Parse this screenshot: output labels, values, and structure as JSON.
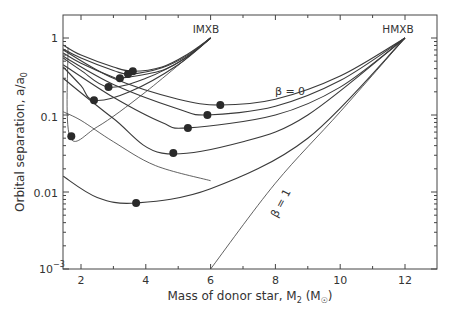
{
  "chart_data": {
    "type": "line",
    "title": "",
    "xlabel": "Mass of donor star, M2 (M☉)",
    "ylabel": "Orbital separation, a/a0",
    "xscale": "linear",
    "yscale": "log",
    "xlim": [
      1.45,
      13.0
    ],
    "ylim": [
      0.001,
      1.6
    ],
    "x_ticks": [
      2,
      4,
      6,
      8,
      10,
      12
    ],
    "y_ticks": [
      "10^-3",
      "0.01",
      "0.1",
      "1"
    ],
    "grid": false,
    "annotations": [
      {
        "text": "IMXB",
        "x": 5.9,
        "y": 1.2
      },
      {
        "text": "HMXB",
        "x": 11.8,
        "y": 1.2
      },
      {
        "text": "β = 0",
        "x": 8.7,
        "y": 0.14
      },
      {
        "text": "β = 1",
        "x": 8.0,
        "y": 0.012,
        "rotation": -62
      }
    ],
    "series": [
      {
        "name": "IMXB β=0",
        "group": "IMXB",
        "points": [
          [
            1.45,
            0.81
          ],
          [
            2,
            0.6
          ],
          [
            3,
            0.42
          ],
          [
            3.6,
            0.37
          ],
          [
            4.5,
            0.42
          ],
          [
            5.3,
            0.62
          ],
          [
            6,
            1.0
          ]
        ],
        "min_point": [
          3.6,
          0.37
        ]
      },
      {
        "name": "IMXB β=0.2",
        "group": "IMXB",
        "points": [
          [
            1.45,
            0.72
          ],
          [
            2,
            0.55
          ],
          [
            3,
            0.38
          ],
          [
            3.5,
            0.34
          ],
          [
            4.5,
            0.41
          ],
          [
            5.3,
            0.6
          ],
          [
            6,
            1.0
          ]
        ],
        "min_point": [
          3.45,
          0.34
        ]
      },
      {
        "name": "IMXB β=0.4",
        "group": "IMXB",
        "points": [
          [
            1.45,
            0.64
          ],
          [
            2,
            0.47
          ],
          [
            3,
            0.31
          ],
          [
            3.2,
            0.3
          ],
          [
            4.5,
            0.38
          ],
          [
            5.3,
            0.58
          ],
          [
            6,
            1.0
          ]
        ],
        "min_point": [
          3.2,
          0.3
        ]
      },
      {
        "name": "IMXB β=0.6",
        "group": "IMXB",
        "points": [
          [
            1.45,
            0.55
          ],
          [
            2,
            0.38
          ],
          [
            2.85,
            0.23
          ],
          [
            4,
            0.3
          ],
          [
            5.2,
            0.54
          ],
          [
            6,
            1.0
          ]
        ],
        "min_point": [
          2.85,
          0.23
        ]
      },
      {
        "name": "IMXB β=0.8",
        "group": "IMXB",
        "points": [
          [
            1.45,
            0.42
          ],
          [
            2,
            0.24
          ],
          [
            2.4,
            0.155
          ],
          [
            3.5,
            0.2
          ],
          [
            5,
            0.45
          ],
          [
            6,
            1.0
          ]
        ],
        "min_point": [
          2.4,
          0.155
        ]
      },
      {
        "name": "IMXB β=1",
        "group": "IMXB",
        "points": [
          [
            1.6,
            0.75
          ],
          [
            1.65,
            0.053
          ],
          [
            2.5,
            0.07
          ],
          [
            4,
            0.2
          ],
          [
            6,
            1.0
          ]
        ],
        "min_point": [
          1.7,
          0.053
        ]
      },
      {
        "name": "HMXB β=0",
        "group": "HMXB",
        "points": [
          [
            1.45,
            0.7
          ],
          [
            3,
            0.3
          ],
          [
            5,
            0.16
          ],
          [
            6.3,
            0.135
          ],
          [
            8,
            0.16
          ],
          [
            10,
            0.32
          ],
          [
            12,
            1.0
          ]
        ],
        "min_point": [
          6.3,
          0.135
        ]
      },
      {
        "name": "HMXB β=0.2",
        "group": "HMXB",
        "points": [
          [
            1.45,
            0.58
          ],
          [
            3,
            0.25
          ],
          [
            5,
            0.12
          ],
          [
            5.9,
            0.1
          ],
          [
            8,
            0.13
          ],
          [
            10,
            0.28
          ],
          [
            12,
            1.0
          ]
        ],
        "min_point": [
          5.9,
          0.1
        ]
      },
      {
        "name": "HMXB β=0.4",
        "group": "HMXB",
        "points": [
          [
            1.45,
            0.45
          ],
          [
            3,
            0.17
          ],
          [
            4.5,
            0.08
          ],
          [
            5.3,
            0.068
          ],
          [
            8,
            0.1
          ],
          [
            10,
            0.23
          ],
          [
            12,
            1.0
          ]
        ],
        "min_point": [
          5.3,
          0.068
        ]
      },
      {
        "name": "HMXB β=0.6",
        "group": "HMXB",
        "points": [
          [
            1.45,
            0.3
          ],
          [
            3,
            0.09
          ],
          [
            4.5,
            0.032
          ],
          [
            7,
            0.045
          ],
          [
            9,
            0.1
          ],
          [
            12,
            1.0
          ]
        ],
        "min_point": [
          4.85,
          0.032
        ]
      },
      {
        "name": "HMXB β=0.8",
        "group": "HMXB",
        "points": [
          [
            1.45,
            0.016
          ],
          [
            2.5,
            0.0085
          ],
          [
            3.7,
            0.0072
          ],
          [
            6,
            0.011
          ],
          [
            9,
            0.05
          ],
          [
            12,
            1.0
          ]
        ],
        "min_point": [
          3.7,
          0.0072
        ]
      },
      {
        "name": "HMXB β=1",
        "group": "HMXB",
        "points": [
          [
            6,
            0.001
          ],
          [
            8,
            0.013
          ],
          [
            10,
            0.11
          ],
          [
            12,
            1.0
          ]
        ]
      },
      {
        "name": "IMXB β=1 (lower)",
        "group": "IMXB",
        "points": [
          [
            1.45,
            0.11
          ],
          [
            2,
            0.085
          ],
          [
            3,
            0.045
          ],
          [
            4.3,
            0.022
          ],
          [
            6,
            0.014
          ]
        ]
      }
    ]
  },
  "axes": {
    "xlabel_main": "Mass of donor star, M",
    "xlabel_sub": "2",
    "xlabel_unit_open": " (M",
    "xlabel_unit_sym": "☉",
    "xlabel_unit_close": ")",
    "ylabel_main": "Orbital separation, a/a",
    "ylabel_sub": "0",
    "xtick_labels": [
      "2",
      "4",
      "6",
      "8",
      "10",
      "12"
    ],
    "ytick_1": "1",
    "ytick_01": "0.1",
    "ytick_001": "0.01",
    "ytick_1e3_base": "10",
    "ytick_1e3_exp": "−3"
  },
  "labels": {
    "imxb": "IMXB",
    "hmxb": "HMXB",
    "beta0": "β = 0",
    "beta1": "β = 1"
  },
  "colors": {
    "line": "#3a3a3a",
    "dot": "#2a2a2a",
    "frame": "#444444"
  }
}
